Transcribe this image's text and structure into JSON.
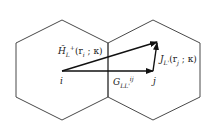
{
  "diagram": {
    "cells": [
      {
        "name": "left-hexagon-cell"
      },
      {
        "name": "right-hexagon-cell"
      }
    ],
    "labels": {
      "site_i": "i",
      "site_j": "j",
      "h_label": "H̃",
      "h_sub": "L",
      "h_sup": "+",
      "h_args": "(r",
      "h_args_sub": "i",
      "h_args_tail": " ; κ)",
      "g_label": "G",
      "g_sub": "LL'",
      "g_sup": "ij",
      "j_label": "J",
      "j_sub": "L'",
      "j_args": "(r",
      "j_args_sub": "j",
      "j_args_tail": " ; κ)"
    }
  }
}
